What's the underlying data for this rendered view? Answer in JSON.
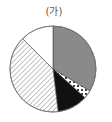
{
  "chart_data": {
    "type": "pie",
    "title": "(가)",
    "start_angle_deg": 0,
    "direction": "clockwise",
    "slices": [
      {
        "name": "gray",
        "pattern": "solid-gray",
        "color": "#8a8a8a",
        "percent": 33.6
      },
      {
        "name": "dotted",
        "pattern": "dots",
        "color": "#000000",
        "percent": 3.1
      },
      {
        "name": "black",
        "pattern": "solid-black",
        "color": "#111111",
        "percent": 11.4
      },
      {
        "name": "hatched",
        "pattern": "diagonal-hatch",
        "color": "#555555",
        "percent": 39.4
      },
      {
        "name": "white",
        "pattern": "solid-white",
        "color": "#ffffff",
        "percent": 12.5
      }
    ],
    "legend": "none",
    "labels": "none"
  },
  "pie": {
    "cx": 53,
    "cy": 69,
    "r": 43
  }
}
